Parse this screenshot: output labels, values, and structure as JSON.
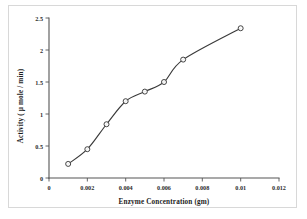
{
  "chart_data": {
    "type": "line",
    "title": "",
    "xlabel": "Enzyme Concentration (gm)",
    "ylabel": "Activity ( µ mole / min)",
    "x": [
      0.001,
      0.002,
      0.003,
      0.004,
      0.005,
      0.006,
      0.007,
      0.01
    ],
    "values": [
      0.22,
      0.45,
      0.84,
      1.2,
      1.35,
      1.5,
      1.85,
      2.34
    ],
    "series": [
      {
        "name": "Activity",
        "points": [
          {
            "x": 0.001,
            "y": 0.22
          },
          {
            "x": 0.002,
            "y": 0.45
          },
          {
            "x": 0.003,
            "y": 0.84
          },
          {
            "x": 0.004,
            "y": 1.2
          },
          {
            "x": 0.005,
            "y": 1.35
          },
          {
            "x": 0.006,
            "y": 1.5
          },
          {
            "x": 0.007,
            "y": 1.85
          },
          {
            "x": 0.01,
            "y": 2.34
          }
        ]
      }
    ],
    "xlim": [
      0,
      0.012
    ],
    "ylim": [
      0,
      2.5
    ],
    "xticks": [
      0,
      0.002,
      0.004,
      0.006,
      0.008,
      0.01,
      0.012
    ],
    "xticklabels": [
      "0",
      "0.002",
      "0.004",
      "0.006",
      "0.008",
      "0.01",
      "0.012"
    ],
    "yticks": [
      0,
      0.5,
      1,
      1.5,
      2,
      2.5
    ],
    "yticklabels": [
      "0",
      "0.5",
      "1",
      "1.5",
      "2",
      "2.5"
    ],
    "grid": false,
    "legend": "none",
    "marker": "open-circle",
    "line_color": "#3a3a3a",
    "marker_color": "#3a3a3a",
    "background_color": "#ffffff",
    "border_color": "#d8d8d8"
  },
  "caption": {
    "bottom_text": ""
  }
}
